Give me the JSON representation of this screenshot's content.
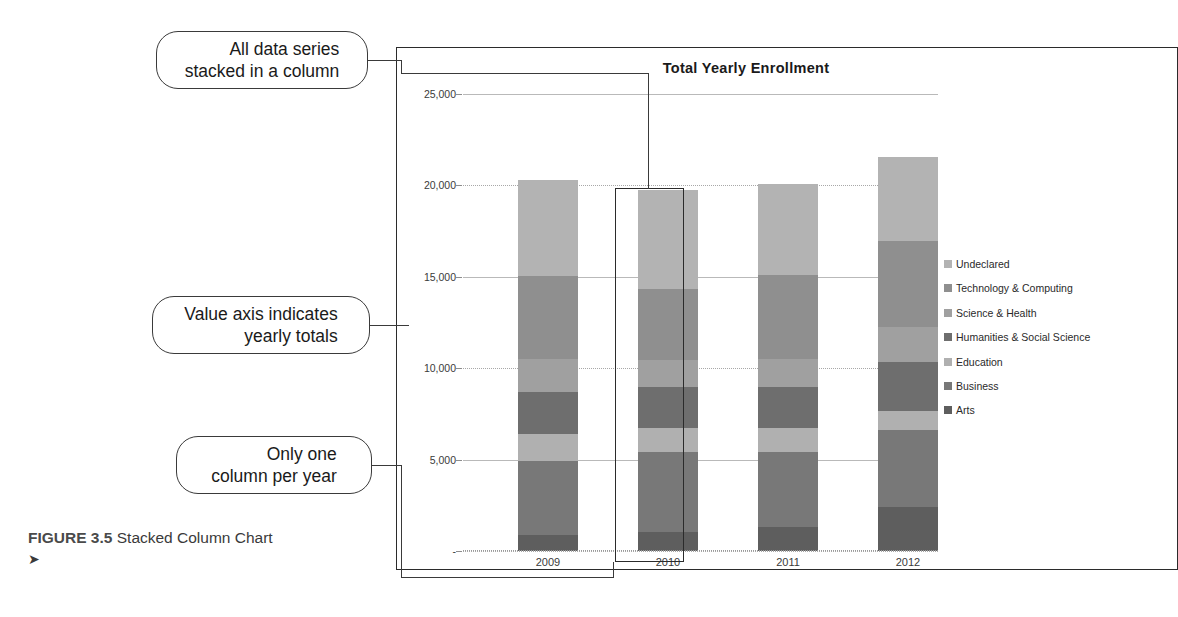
{
  "figure": {
    "label": "FIGURE 3.5",
    "caption": "Stacked Column Chart",
    "arrow": "➤"
  },
  "callouts": [
    {
      "id": "all-data-series",
      "line1": "All data series",
      "line2": "stacked in a column"
    },
    {
      "id": "value-axis",
      "line1": "Value axis indicates",
      "line2": "yearly totals"
    },
    {
      "id": "one-column-per-year",
      "line1": "Only one",
      "line2": "column per year"
    }
  ],
  "colors": {
    "undeclared": "#b3b3b3",
    "technology_computing": "#8f8f8f",
    "science_health": "#a0a0a0",
    "humanities_social_science": "#6e6e6e",
    "education": "#b0b0b0",
    "business": "#787878",
    "arts": "#5e5e5e",
    "frame": "#2b2b2b",
    "gridline": "#b9b9b9",
    "highlight": "#2b2b2b"
  },
  "chart_data": {
    "type": "bar",
    "subtype": "stacked-column",
    "title": "Total Yearly Enrollment",
    "xlabel": "",
    "ylabel": "",
    "categories": [
      "2009",
      "2010",
      "2011",
      "2012"
    ],
    "ylim": [
      0,
      25000
    ],
    "yticks": [
      0,
      5000,
      10000,
      15000,
      20000,
      25000
    ],
    "ytick_labels": [
      "-",
      "5,000",
      "10,000",
      "15,000",
      "20,000",
      "25,000"
    ],
    "grid": true,
    "legend_position": "right",
    "stack_order_bottom_to_top": [
      "Arts",
      "Business",
      "Education",
      "Humanities & Social Science",
      "Science & Health",
      "Technology & Computing",
      "Undeclared"
    ],
    "series": [
      {
        "name": "Undeclared",
        "color": "#b3b3b3",
        "values": [
          5250,
          5400,
          5000,
          4600
        ]
      },
      {
        "name": "Technology & Computing",
        "color": "#8f8f8f",
        "values": [
          4550,
          3900,
          4600,
          4700
        ]
      },
      {
        "name": "Science & Health",
        "color": "#a0a0a0",
        "values": [
          1800,
          1500,
          1550,
          1900
        ]
      },
      {
        "name": "Humanities & Social Science",
        "color": "#6e6e6e",
        "values": [
          2300,
          2200,
          2200,
          2700
        ]
      },
      {
        "name": "Education",
        "color": "#b0b0b0",
        "values": [
          1450,
          1350,
          1350,
          1050
        ]
      },
      {
        "name": "Business",
        "color": "#787878",
        "values": [
          4050,
          4350,
          4100,
          4200
        ]
      },
      {
        "name": "Arts",
        "color": "#5e5e5e",
        "values": [
          900,
          1050,
          1300,
          2400
        ]
      }
    ],
    "totals": [
      20300,
      19750,
      20100,
      21550
    ]
  },
  "legend": {
    "items": [
      {
        "label": "Undeclared",
        "color": "#b3b3b3"
      },
      {
        "label": "Technology & Computing",
        "color": "#8f8f8f"
      },
      {
        "label": "Science & Health",
        "color": "#a0a0a0"
      },
      {
        "label": "Humanities & Social Science",
        "color": "#6e6e6e"
      },
      {
        "label": "Education",
        "color": "#b0b0b0"
      },
      {
        "label": "Business",
        "color": "#787878"
      },
      {
        "label": "Arts",
        "color": "#5e5e5e"
      }
    ]
  },
  "highlight": {
    "category": "2010"
  }
}
